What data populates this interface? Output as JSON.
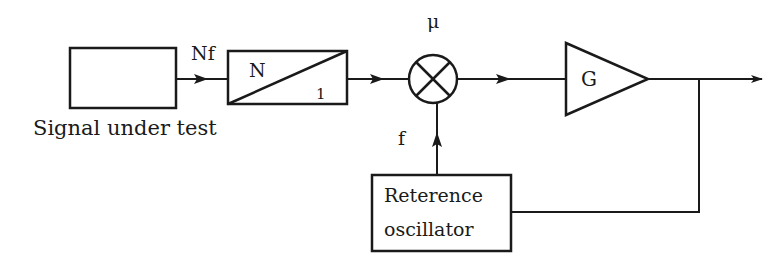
{
  "diagram": {
    "type": "block-diagram",
    "blocks": {
      "signal_source": {
        "label": "Signal under test"
      },
      "divider": {
        "numerator": "N",
        "denominator": "1"
      },
      "mixer": {
        "label": "μ"
      },
      "amplifier": {
        "label": "G"
      },
      "reference_oscillator": {
        "line1": "Reterence",
        "line2": "oscillator"
      }
    },
    "signals": {
      "input_freq": "Nf",
      "reference_freq": "f"
    },
    "colors": {
      "stroke": "#1a1a1a",
      "background": "#ffffff"
    }
  }
}
